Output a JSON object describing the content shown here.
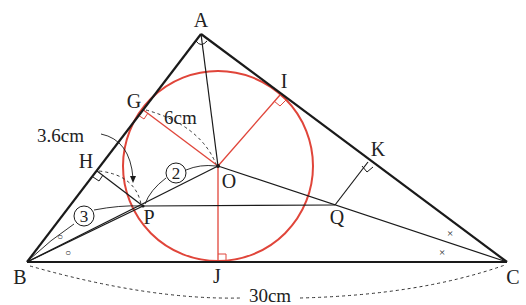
{
  "diagram": {
    "points": {
      "A": "A",
      "B": "B",
      "C": "C",
      "O": "O",
      "G": "G",
      "H": "H",
      "I": "I",
      "J": "J",
      "K": "K",
      "P": "P",
      "Q": "Q"
    },
    "measurements": {
      "radius_label": "6cm",
      "bh_label": "3.6cm",
      "bc_label": "30cm"
    },
    "markers": {
      "circled_2": "2",
      "circled_3": "3",
      "angle_mark_B": "○",
      "angle_mark_C": "×"
    },
    "colors": {
      "line": "#1a1a1a",
      "circle": "#e0453a",
      "radius": "#e0453a",
      "dashed": "#333333"
    },
    "notes": {
      "A_angle": "right angle at A",
      "incircle_tangent_points": [
        "G",
        "I",
        "J"
      ],
      "angle_bisectors": [
        "BO (○ equal angles)",
        "CO (× equal angles)",
        "AO"
      ],
      "ratio": "PO : BP = 2 : 3",
      "PQ_parallel_BC": true
    }
  }
}
